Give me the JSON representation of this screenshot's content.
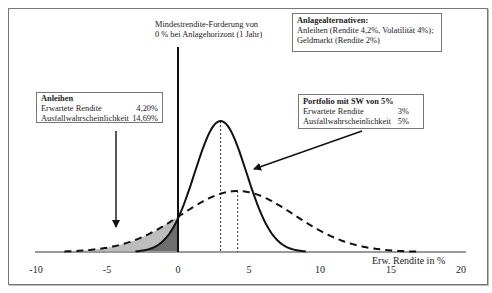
{
  "chart_data": {
    "type": "line",
    "title": "",
    "xlabel": "Erw. Rendite in %",
    "ylabel": "",
    "xlim": [
      -10,
      20
    ],
    "x_ticks": [
      "-10",
      "-5",
      "0",
      "5",
      "10",
      "15",
      "20"
    ],
    "grid": false,
    "series": [
      {
        "name": "Portfolio mit SW von 5%",
        "style": "solid",
        "distribution": "normal",
        "mean": 3,
        "std": 1.82,
        "x_range": [
          -3,
          9
        ],
        "shaded_below_zero": true,
        "shade_color": "#6e6e6e"
      },
      {
        "name": "Anleihen",
        "style": "dashed",
        "distribution": "normal",
        "mean": 4.2,
        "std": 4,
        "x_range": [
          -8,
          17
        ],
        "shaded_below_zero": true,
        "shade_color": "#bdbdbd"
      }
    ],
    "reference_lines": [
      {
        "x": 0,
        "style": "solid",
        "label": "Mindestrendite-Forderung von 0 % bei Anlagehorizont (1 Jahr)"
      },
      {
        "x": 3,
        "style": "dotted"
      },
      {
        "x": 4.2,
        "style": "dotted"
      }
    ],
    "annotations": [
      {
        "title": "Anleihen",
        "rows": [
          [
            "Erwartete Rendite",
            "4,20%"
          ],
          [
            "Ausfallwahrscheinlichkeit",
            "14,69%"
          ]
        ]
      },
      {
        "title": "Portfolio mit SW von 5%",
        "rows": [
          [
            "Erwartete Rendite",
            "3%"
          ],
          [
            "Ausfallwahrscheinlichkeit",
            "5%"
          ]
        ]
      },
      {
        "title": "Anlagealternativen:",
        "lines": [
          "Anleihen (Rendite 4,2%, Volatilität 4%);",
          "Geldmarkt (Rendite 2%)"
        ]
      }
    ]
  },
  "labels": {
    "min_return_line1": "Mindestrendite-Forderung von",
    "min_return_line2": "0 % bei Anlagehorizont (1 Jahr)",
    "x_axis_label": "Erw. Rendite in %",
    "ticks": [
      "-10",
      "-5",
      "0",
      "5",
      "10",
      "15",
      "20"
    ]
  },
  "bonds_box": {
    "title": "Anleihen",
    "row1_label": "Erwartete Rendite",
    "row1_value": "4,20%",
    "row2_label": "Ausfallwahrscheinlichkeit",
    "row2_value": "14,69%"
  },
  "portfolio_box": {
    "title": "Portfolio mit SW von 5%",
    "row1_label": "Erwartete Rendite",
    "row1_value": "3%",
    "row2_label": "Ausfallwahrscheinlichkeit",
    "row2_value": "5%"
  },
  "alternatives_box": {
    "title": "Anlagealternativen:",
    "line1": "Anleihen (Rendite 4,2%, Volatilität 4%);",
    "line2": "Geldmarkt (Rendite 2%)"
  },
  "colors": {
    "line": "#111111",
    "axis": "#9a9a9a",
    "shade_light": "#bdbdbd",
    "shade_dark": "#6e6e6e"
  }
}
